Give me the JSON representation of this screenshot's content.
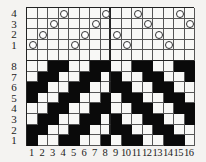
{
  "colors": {
    "filled": "#0a0a0a",
    "empty": "#f8f8f6",
    "grid_line": "#555555",
    "background": "#f4f3f1"
  },
  "threading": {
    "row_labels": [
      "4",
      "3",
      "2",
      "1"
    ],
    "shafts_per_end": [
      1,
      2,
      3,
      4,
      1,
      2,
      3,
      4,
      2,
      1,
      4,
      3,
      2,
      1,
      4,
      3
    ],
    "mark": "circle-icon"
  },
  "drawdown": {
    "row_labels": [
      "8",
      "7",
      "6",
      "5",
      "4",
      "3",
      "2",
      "1"
    ],
    "rows": [
      "WWBBWWBBWWBBWWBB",
      "WBBWWBBWBWWBBWWB",
      "BBWWBBWWBBWWBBWW",
      "BWWBBWWBWBBWWBBW",
      "WWBBWWBBWWBBWWBB",
      "WBBWWBBWBWWBBWWB",
      "BBWWBBWWBBWWBBWW",
      "BWWBBWWBWBBWWBBW"
    ]
  },
  "column_labels": [
    "1",
    "2",
    "3",
    "4",
    "5",
    "6",
    "7",
    "8",
    "9",
    "10",
    "11",
    "12",
    "13",
    "14",
    "15",
    "16"
  ]
}
